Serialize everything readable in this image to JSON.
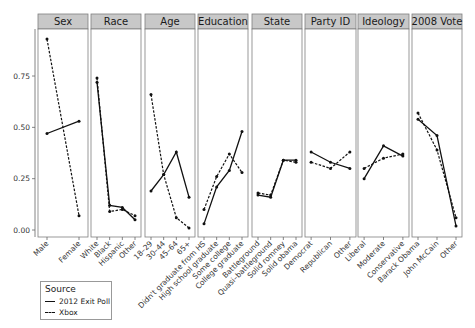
{
  "chart_data": {
    "type": "line",
    "title": "",
    "xlabel": "",
    "ylabel": "",
    "ylim": [
      0,
      1.0
    ],
    "yticks": [
      "0.00",
      "0.25",
      "0.50",
      "0.75"
    ],
    "grid": false,
    "legend_position": "bottom-left",
    "legend": {
      "title": "Source",
      "entries": [
        {
          "name": "2012 Exit Poll",
          "style": "solid"
        },
        {
          "name": "Xbox",
          "style": "dashed"
        }
      ]
    },
    "panels": [
      {
        "title": "Sex",
        "categories": [
          "Male",
          "Female"
        ],
        "series": [
          {
            "name": "2012 Exit Poll",
            "values": [
              0.47,
              0.53
            ]
          },
          {
            "name": "Xbox",
            "values": [
              0.93,
              0.07
            ]
          }
        ]
      },
      {
        "title": "Race",
        "categories": [
          "White",
          "Black",
          "Hispanic",
          "Other"
        ],
        "series": [
          {
            "name": "2012 Exit Poll",
            "values": [
              0.72,
              0.12,
              0.11,
              0.05
            ]
          },
          {
            "name": "Xbox",
            "values": [
              0.74,
              0.09,
              0.1,
              0.07
            ]
          }
        ]
      },
      {
        "title": "Age",
        "categories": [
          "18–29",
          "30–44",
          "45–64",
          "65+"
        ],
        "series": [
          {
            "name": "2012 Exit Poll",
            "values": [
              0.19,
              0.27,
              0.38,
              0.16
            ]
          },
          {
            "name": "Xbox",
            "values": [
              0.66,
              0.27,
              0.06,
              0.01
            ]
          }
        ]
      },
      {
        "title": "Education",
        "categories": [
          "Didn't graduate from HS",
          "High school graduate",
          "Some college",
          "College graduate"
        ],
        "series": [
          {
            "name": "2012 Exit Poll",
            "values": [
              0.03,
              0.21,
              0.29,
              0.48
            ]
          },
          {
            "name": "Xbox",
            "values": [
              0.1,
              0.26,
              0.37,
              0.28
            ]
          }
        ]
      },
      {
        "title": "State",
        "categories": [
          "Battleground",
          "Quasi–battleground",
          "Solid romney",
          "Solid obama"
        ],
        "series": [
          {
            "name": "2012 Exit Poll",
            "values": [
              0.17,
              0.16,
              0.34,
              0.34
            ]
          },
          {
            "name": "Xbox",
            "values": [
              0.18,
              0.17,
              0.34,
              0.33
            ]
          }
        ]
      },
      {
        "title": "Party ID",
        "categories": [
          "Democrat",
          "Republican",
          "Other"
        ],
        "series": [
          {
            "name": "2012 Exit Poll",
            "values": [
              0.38,
              0.33,
              0.3
            ]
          },
          {
            "name": "Xbox",
            "values": [
              0.33,
              0.3,
              0.38
            ]
          }
        ]
      },
      {
        "title": "Ideology",
        "categories": [
          "Liberal",
          "Moderate",
          "Conservative"
        ],
        "series": [
          {
            "name": "2012 Exit Poll",
            "values": [
              0.25,
              0.41,
              0.36
            ]
          },
          {
            "name": "Xbox",
            "values": [
              0.3,
              0.35,
              0.37
            ]
          }
        ]
      },
      {
        "title": "2008 Vote",
        "categories": [
          "Barack Obama",
          "John McCain",
          "Other"
        ],
        "series": [
          {
            "name": "2012 Exit Poll",
            "values": [
              0.54,
              0.46,
              0.02
            ]
          },
          {
            "name": "Xbox",
            "values": [
              0.57,
              0.39,
              0.06
            ]
          }
        ]
      }
    ]
  },
  "colors": {
    "strip_fill": "#c8c8c8",
    "panel_border": "#7f7f7f",
    "line": "#111111"
  }
}
